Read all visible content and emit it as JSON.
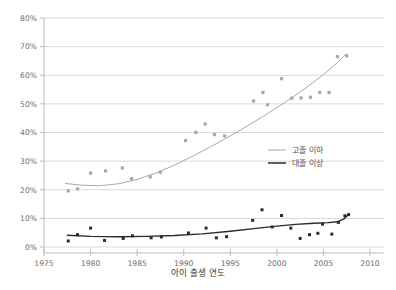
{
  "chart_data": {
    "type": "scatter",
    "title": "",
    "xlabel": "아이 출생 연도",
    "ylabel": "",
    "xlim": [
      1975,
      2011.5
    ],
    "ylim": [
      0,
      80
    ],
    "xticks": [
      "1975",
      "1980",
      "1985",
      "1990",
      "1995",
      "2000",
      "2005",
      "2010"
    ],
    "xtick_values": [
      1975,
      1980,
      1985,
      1990,
      1995,
      2000,
      2005,
      2010
    ],
    "yticks": [
      "0%",
      "10%",
      "20%",
      "30%",
      "40%",
      "50%",
      "60%",
      "70%",
      "80%"
    ],
    "ytick_values": [
      0,
      10,
      20,
      30,
      40,
      50,
      60,
      70,
      80
    ],
    "grid": "horizontal",
    "legend_position": "center-right",
    "series": [
      {
        "name": "고졸 이하",
        "color": "#a8a8a8",
        "marker": "square",
        "points": [
          {
            "x": 1977.6,
            "y": 19.6
          },
          {
            "x": 1978.6,
            "y": 20.3
          },
          {
            "x": 1980.0,
            "y": 25.8
          },
          {
            "x": 1981.6,
            "y": 26.6
          },
          {
            "x": 1983.4,
            "y": 27.6
          },
          {
            "x": 1984.4,
            "y": 23.9
          },
          {
            "x": 1986.4,
            "y": 24.5
          },
          {
            "x": 1987.5,
            "y": 26.1
          },
          {
            "x": 1990.2,
            "y": 37.2
          },
          {
            "x": 1991.3,
            "y": 40.0
          },
          {
            "x": 1992.3,
            "y": 43.0
          },
          {
            "x": 1993.3,
            "y": 39.3
          },
          {
            "x": 1994.4,
            "y": 38.8
          },
          {
            "x": 1997.5,
            "y": 51.0
          },
          {
            "x": 1998.5,
            "y": 54.0
          },
          {
            "x": 1999.0,
            "y": 49.7
          },
          {
            "x": 2000.5,
            "y": 58.8
          },
          {
            "x": 2001.6,
            "y": 52.0
          },
          {
            "x": 2002.6,
            "y": 52.1
          },
          {
            "x": 2003.6,
            "y": 52.3
          },
          {
            "x": 2004.6,
            "y": 54.0
          },
          {
            "x": 2005.6,
            "y": 54.0
          },
          {
            "x": 2006.5,
            "y": 66.5
          },
          {
            "x": 2007.5,
            "y": 66.8
          }
        ],
        "trend": [
          {
            "x": 1977.3,
            "y": 22.2
          },
          {
            "x": 1979.0,
            "y": 21.6
          },
          {
            "x": 1981.0,
            "y": 21.4
          },
          {
            "x": 1983.0,
            "y": 22.1
          },
          {
            "x": 1985.0,
            "y": 23.6
          },
          {
            "x": 1987.0,
            "y": 25.8
          },
          {
            "x": 1989.0,
            "y": 28.6
          },
          {
            "x": 1991.0,
            "y": 31.8
          },
          {
            "x": 1993.0,
            "y": 35.2
          },
          {
            "x": 1995.0,
            "y": 38.8
          },
          {
            "x": 1997.0,
            "y": 42.6
          },
          {
            "x": 1999.0,
            "y": 46.6
          },
          {
            "x": 2001.0,
            "y": 50.8
          },
          {
            "x": 2003.0,
            "y": 55.3
          },
          {
            "x": 2005.0,
            "y": 60.2
          },
          {
            "x": 2006.5,
            "y": 64.4
          },
          {
            "x": 2007.4,
            "y": 67.4
          }
        ]
      },
      {
        "name": "대졸 이상",
        "color": "#2b2b2b",
        "marker": "square",
        "points": [
          {
            "x": 1977.6,
            "y": 2.1
          },
          {
            "x": 1978.6,
            "y": 4.3
          },
          {
            "x": 1980.0,
            "y": 6.6
          },
          {
            "x": 1981.5,
            "y": 2.3
          },
          {
            "x": 1983.5,
            "y": 3.0
          },
          {
            "x": 1984.5,
            "y": 3.9
          },
          {
            "x": 1986.5,
            "y": 3.2
          },
          {
            "x": 1987.6,
            "y": 3.5
          },
          {
            "x": 1990.5,
            "y": 4.9
          },
          {
            "x": 1992.4,
            "y": 6.6
          },
          {
            "x": 1993.5,
            "y": 3.2
          },
          {
            "x": 1994.6,
            "y": 3.6
          },
          {
            "x": 1997.4,
            "y": 9.3
          },
          {
            "x": 1998.4,
            "y": 13.0
          },
          {
            "x": 1999.5,
            "y": 7.0
          },
          {
            "x": 2000.5,
            "y": 11.0
          },
          {
            "x": 2001.5,
            "y": 6.6
          },
          {
            "x": 2002.5,
            "y": 3.0
          },
          {
            "x": 2003.5,
            "y": 4.3
          },
          {
            "x": 2004.4,
            "y": 4.8
          },
          {
            "x": 2004.9,
            "y": 8.0
          },
          {
            "x": 2005.9,
            "y": 4.5
          },
          {
            "x": 2006.6,
            "y": 8.6
          },
          {
            "x": 2007.3,
            "y": 10.9
          },
          {
            "x": 2007.7,
            "y": 11.3
          }
        ],
        "trend": [
          {
            "x": 1977.5,
            "y": 4.1
          },
          {
            "x": 1980.0,
            "y": 3.7
          },
          {
            "x": 1983.0,
            "y": 3.6
          },
          {
            "x": 1986.0,
            "y": 3.7
          },
          {
            "x": 1989.0,
            "y": 4.0
          },
          {
            "x": 1992.0,
            "y": 4.6
          },
          {
            "x": 1995.0,
            "y": 5.5
          },
          {
            "x": 1998.0,
            "y": 6.6
          },
          {
            "x": 2000.0,
            "y": 7.3
          },
          {
            "x": 2002.0,
            "y": 7.9
          },
          {
            "x": 2004.0,
            "y": 8.3
          },
          {
            "x": 2005.5,
            "y": 8.5
          },
          {
            "x": 2006.5,
            "y": 8.8
          },
          {
            "x": 2007.2,
            "y": 9.8
          },
          {
            "x": 2007.7,
            "y": 11.4
          }
        ]
      }
    ]
  },
  "legend": {
    "items": [
      {
        "label": "고졸 이하",
        "color": "#b0b0b0"
      },
      {
        "label": "대졸 이상",
        "color": "#2b2b2b"
      }
    ]
  },
  "colors": {
    "grid": "#d9d9d9",
    "axis": "#bdbdbd",
    "low_edu": "#a8a8a8",
    "high_edu": "#2b2b2b",
    "tick_text": "#6e6e6e",
    "axis_title": "#3a3a3a"
  }
}
